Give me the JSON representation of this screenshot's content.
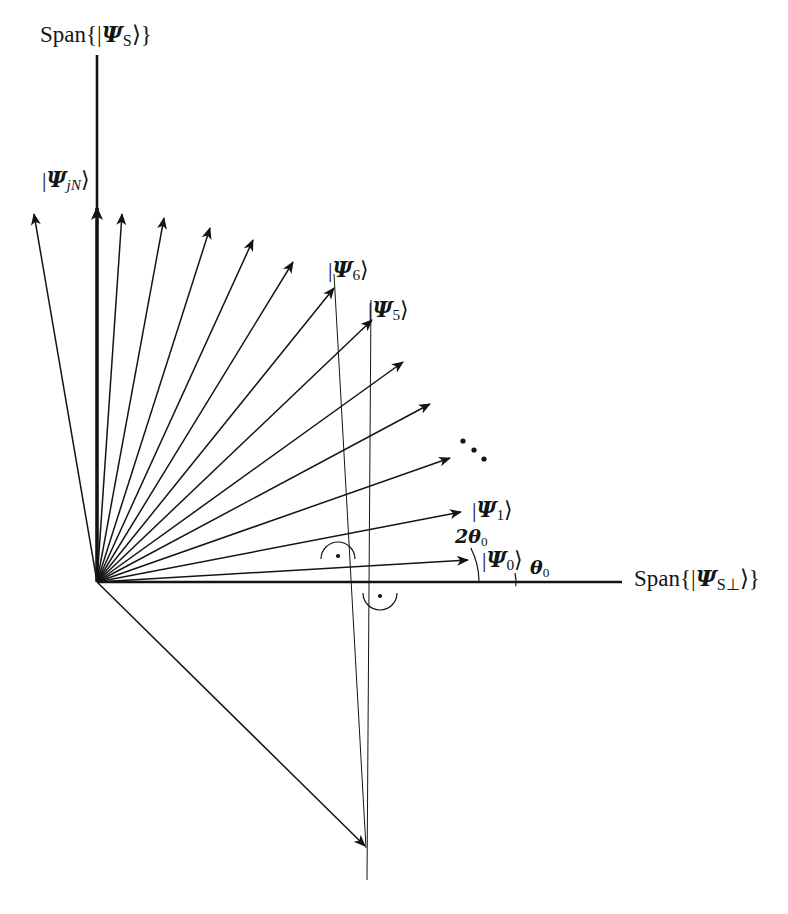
{
  "figure": {
    "type": "vector-diagram",
    "background_color": "#ffffff",
    "ink_color": "#141414"
  },
  "axes": {
    "vertical": {
      "label_prefix": "Span{",
      "label_suffix": "}",
      "ket_open": "|",
      "ket_close": "⟩",
      "psi": "Ψ",
      "psi_sub": "S",
      "label_plain": "Span{|ΨS⟩}",
      "label_x": 40,
      "label_y": 22,
      "x": 97,
      "y_top": 55,
      "y_bottom": 582
    },
    "horizontal": {
      "label_prefix": "Span{",
      "label_suffix": "}",
      "ket_open": "|",
      "ket_close": "⟩",
      "psi": "Ψ",
      "psi_sub": "S⊥",
      "label_plain": "Span{|ΨS⊥⟩}",
      "label_x": 634,
      "label_y": 566,
      "y": 582,
      "x_left": 97,
      "x_right": 622
    }
  },
  "origin": {
    "x": 97,
    "y": 582
  },
  "angles": [
    {
      "id": "theta0",
      "text": "θ0",
      "glyph": "θ",
      "sub": "0",
      "x": 530,
      "y": 558,
      "arc_radius": 62,
      "arc_from_deg": 0,
      "arc_to_deg": 7
    },
    {
      "id": "two-theta0",
      "text": "2θ0",
      "glyph": "2θ",
      "sub": "0",
      "x": 455,
      "y": 527,
      "arc_radius": 120,
      "arc_from_deg": 7,
      "arc_to_deg": 21
    }
  ],
  "right_angle_marks": [
    {
      "id": "upper",
      "x": 338,
      "y": 556,
      "note": "right angle mark with centre dot above the horizontal axis"
    },
    {
      "id": "lower",
      "x": 380,
      "y": 596,
      "note": "right angle mark with centre dot below the horizontal axis"
    }
  ],
  "ellipsis": {
    "note": "three diagonal dots indicating omitted intermediate vectors",
    "dots": [
      {
        "x": 463,
        "y": 441
      },
      {
        "x": 474,
        "y": 450
      },
      {
        "x": 484,
        "y": 459
      }
    ]
  },
  "guide_lines": [
    {
      "id": "guide-psi6",
      "x1": 334,
      "y1": 274,
      "x2": 366,
      "y2": 848
    },
    {
      "id": "guide-psi5",
      "x1": 371,
      "y1": 300,
      "x2": 367,
      "y2": 880
    }
  ],
  "vectors": [
    {
      "id": "psi0",
      "label": "|Ψ0⟩",
      "psi": "Ψ",
      "sub": "0",
      "angle_deg": 7,
      "length": 374,
      "tip_x": 468,
      "tip_y": 560,
      "label_x": 482,
      "label_y": 548,
      "labeled": true,
      "bold": false
    },
    {
      "id": "psi1",
      "label": "|Ψ1⟩",
      "psi": "Ψ",
      "sub": "1",
      "angle_deg": 21,
      "length": 390,
      "tip_x": 461,
      "tip_y": 512,
      "label_x": 472,
      "label_y": 498,
      "labeled": true,
      "bold": false
    },
    {
      "id": "psi2",
      "label": "",
      "psi": "Ψ",
      "sub": "2",
      "angle_deg": 35,
      "length": 390,
      "tip_x": 450,
      "tip_y": 458,
      "label_x": 0,
      "label_y": 0,
      "labeled": false,
      "bold": false
    },
    {
      "id": "psi3",
      "label": "",
      "psi": "Ψ",
      "sub": "3",
      "angle_deg": 49,
      "length": 390,
      "tip_x": 430,
      "tip_y": 404,
      "label_x": 0,
      "label_y": 0,
      "labeled": false,
      "bold": false
    },
    {
      "id": "psi4",
      "label": "",
      "psi": "Ψ",
      "sub": "4",
      "angle_deg": 63,
      "length": 390,
      "tip_x": 403,
      "tip_y": 362,
      "label_x": 0,
      "label_y": 0,
      "labeled": false,
      "bold": false
    },
    {
      "id": "psi5",
      "label": "|Ψ5⟩",
      "psi": "Ψ",
      "sub": "5",
      "angle_deg": 77,
      "length": 393,
      "tip_x": 372,
      "tip_y": 320,
      "label_x": 368,
      "label_y": 298,
      "labeled": true,
      "bold": false
    },
    {
      "id": "psi6",
      "label": "|Ψ6⟩",
      "psi": "Ψ",
      "sub": "6",
      "angle_deg": 91,
      "length": 395,
      "tip_x": 334,
      "tip_y": 288,
      "label_x": 328,
      "label_y": 258,
      "labeled": true,
      "bold": false
    },
    {
      "id": "psi7",
      "label": "",
      "psi": "Ψ",
      "sub": "7",
      "angle_deg": 105,
      "length": 392,
      "tip_x": 293,
      "tip_y": 262,
      "label_x": 0,
      "label_y": 0,
      "labeled": false,
      "bold": false
    },
    {
      "id": "psi8",
      "label": "",
      "psi": "Ψ",
      "sub": "8",
      "angle_deg": 119,
      "length": 389,
      "tip_x": 253,
      "tip_y": 240,
      "label_x": 0,
      "label_y": 0,
      "labeled": false,
      "bold": false
    },
    {
      "id": "psi9",
      "label": "",
      "psi": "Ψ",
      "sub": "9",
      "angle_deg": 133,
      "length": 386,
      "tip_x": 210,
      "tip_y": 228,
      "label_x": 0,
      "label_y": 0,
      "labeled": false,
      "bold": false
    },
    {
      "id": "psi10",
      "label": "",
      "psi": "Ψ",
      "sub": "10",
      "angle_deg": 147,
      "length": 382,
      "tip_x": 164,
      "tip_y": 218,
      "label_x": 0,
      "label_y": 0,
      "labeled": false,
      "bold": false
    },
    {
      "id": "psijn",
      "label": "|ΨjN⟩",
      "psi": "Ψ",
      "sub": "jN",
      "angle_deg": 161,
      "length": 378,
      "tip_x": 122,
      "tip_y": 214,
      "label_x": 42,
      "label_y": 168,
      "labeled": true,
      "bold": false
    },
    {
      "id": "psi-axis-bold",
      "label": "",
      "psi": "Ψ",
      "sub": "",
      "angle_deg": 175,
      "length": 378,
      "tip_x": 97,
      "tip_y": 208,
      "label_x": 0,
      "label_y": 0,
      "labeled": false,
      "bold": true
    },
    {
      "id": "psi-leftmost",
      "label": "",
      "psi": "Ψ",
      "sub": "",
      "angle_deg": 189,
      "length": 375,
      "tip_x": 34,
      "tip_y": 214,
      "label_x": 0,
      "label_y": 0,
      "labeled": false,
      "bold": false
    },
    {
      "id": "psi-down",
      "label": "",
      "psi": "Ψ",
      "sub": "",
      "angle_deg": 311,
      "length": 400,
      "tip_x": 365,
      "tip_y": 846,
      "label_x": 0,
      "label_y": 0,
      "labeled": false,
      "bold": false
    }
  ]
}
